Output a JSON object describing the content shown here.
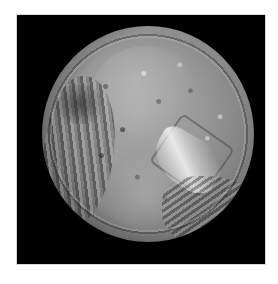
{
  "image": {
    "subject": "grayscale photograph of a cratered moon on a black background",
    "colors": {
      "page_background": "#ffffff",
      "frame_background": "#000000",
      "surface_mid_gray": "#9a9a9a",
      "highlight": "#eaeaea"
    }
  }
}
